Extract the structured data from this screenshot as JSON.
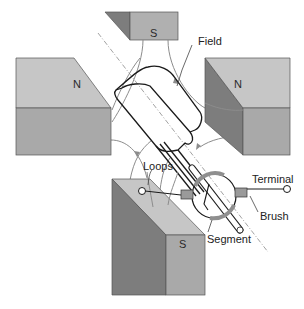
{
  "diagram": {
    "labels": {
      "top_magnet_pole": "S",
      "left_magnet_pole": "N",
      "right_magnet_pole": "N",
      "bottom_magnet_pole": "S",
      "field": "Field",
      "loops": "Loops",
      "terminal": "Terminal",
      "brush": "Brush",
      "segment": "Segment"
    },
    "icons": {
      "magnet": "rectangular-prism-magnet",
      "terminal": "open-circle-terminal",
      "brush": "carbon-brush-block",
      "commutator": "split-ring-commutator"
    },
    "colors": {
      "magnet_top_face": "#c6c6c6",
      "magnet_front_face": "#a9a9a9",
      "magnet_dark_face": "#7d7d7d",
      "field_line": "#8c8c8c",
      "loop_line": "#1a1a1a",
      "axis_line": "#8a8a8a",
      "segment": "#8f8f8f"
    }
  }
}
